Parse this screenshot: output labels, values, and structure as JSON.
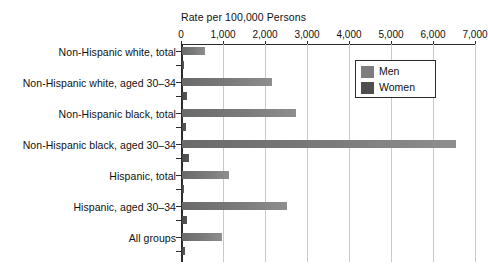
{
  "chart_data": {
    "type": "bar",
    "orientation": "horizontal",
    "title": "",
    "xlabel": "Rate per 100,000 Persons",
    "ylabel": "",
    "xlim": [
      0,
      7000
    ],
    "xticks": [
      0,
      1000,
      2000,
      3000,
      4000,
      5000,
      6000,
      7000
    ],
    "xtick_labels": [
      "0",
      "1,000",
      "2,000",
      "3,000",
      "4,000",
      "5,000",
      "6,000",
      "7,000"
    ],
    "grid": true,
    "grid_axis": "x",
    "legend_position": "upper-right-inside",
    "categories": [
      "Non-Hispanic white, total",
      "Non-Hispanic white, aged 30–34",
      "Non-Hispanic black, total",
      "Non-Hispanic black, aged 30–34",
      "Hispanic, total",
      "Hispanic, aged 30–34",
      "All groups"
    ],
    "series": [
      {
        "name": "Men",
        "color": "#7d7d7d",
        "values": [
          550,
          2140,
          2715,
          6520,
          1120,
          2500,
          950
        ]
      },
      {
        "name": "Women",
        "color": "#4f4f4f",
        "values": [
          50,
          120,
          100,
          170,
          45,
          120,
          75
        ]
      }
    ]
  },
  "legend": {
    "entries": [
      {
        "label": "Men",
        "swatch": "men"
      },
      {
        "label": "Women",
        "swatch": "women"
      }
    ]
  }
}
